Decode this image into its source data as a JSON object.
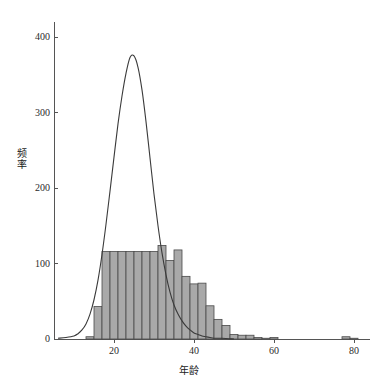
{
  "chart_data": {
    "type": "bar",
    "title": "",
    "subtitle": "",
    "xlabel": "年龄",
    "ylabel": "频率",
    "xlim": [
      5,
      84
    ],
    "ylim": [
      0,
      420
    ],
    "grid": false,
    "legend": null,
    "x_ticks": [
      {
        "value": 20,
        "label": "20"
      },
      {
        "value": 40,
        "label": "40"
      },
      {
        "value": 60,
        "label": "60"
      },
      {
        "value": 80,
        "label": "80"
      }
    ],
    "y_ticks": [
      {
        "value": 0,
        "label": "0"
      },
      {
        "value": 100,
        "label": "100"
      },
      {
        "value": 200,
        "label": "200"
      },
      {
        "value": 300,
        "label": "300"
      },
      {
        "value": 400,
        "label": "400"
      }
    ],
    "bin_width": 2,
    "bar_fill": "#a9a9a9",
    "bar_stroke": "#4a4a4a",
    "curve_color": "#3a3a3a",
    "axis_color": "#555555",
    "bars": [
      {
        "x0": 13,
        "x1": 15,
        "height": 3
      },
      {
        "x0": 15,
        "x1": 17,
        "height": 43
      },
      {
        "x0": 17,
        "x1": 19,
        "height": 116
      },
      {
        "x0": 19,
        "x1": 21,
        "height": 116
      },
      {
        "x0": 21,
        "x1": 23,
        "height": 116
      },
      {
        "x0": 23,
        "x1": 25,
        "height": 116
      },
      {
        "x0": 25,
        "x1": 27,
        "height": 116
      },
      {
        "x0": 27,
        "x1": 29,
        "height": 116
      },
      {
        "x0": 29,
        "x1": 31,
        "height": 116
      },
      {
        "x0": 31,
        "x1": 33,
        "height": 124
      },
      {
        "x0": 33,
        "x1": 35,
        "height": 104
      },
      {
        "x0": 35,
        "x1": 37,
        "height": 118
      },
      {
        "x0": 37,
        "x1": 39,
        "height": 83
      },
      {
        "x0": 39,
        "x1": 41,
        "height": 73
      },
      {
        "x0": 41,
        "x1": 43,
        "height": 74
      },
      {
        "x0": 43,
        "x1": 45,
        "height": 44
      },
      {
        "x0": 45,
        "x1": 47,
        "height": 26
      },
      {
        "x0": 47,
        "x1": 49,
        "height": 18
      },
      {
        "x0": 49,
        "x1": 51,
        "height": 6
      },
      {
        "x0": 51,
        "x1": 53,
        "height": 5
      },
      {
        "x0": 53,
        "x1": 55,
        "height": 5
      },
      {
        "x0": 55,
        "x1": 57,
        "height": 2
      },
      {
        "x0": 57,
        "x1": 59,
        "height": 1
      },
      {
        "x0": 59,
        "x1": 61,
        "height": 2
      },
      {
        "x0": 77,
        "x1": 79,
        "height": 3
      },
      {
        "x0": 79,
        "x1": 81,
        "height": 1
      }
    ],
    "curve": {
      "name": "density-curve",
      "peak_x": 24,
      "peak_y": 375,
      "points": [
        {
          "x": 6,
          "y": 1
        },
        {
          "x": 8,
          "y": 2
        },
        {
          "x": 10,
          "y": 4
        },
        {
          "x": 11,
          "y": 7
        },
        {
          "x": 12,
          "y": 12
        },
        {
          "x": 13,
          "y": 20
        },
        {
          "x": 14,
          "y": 33
        },
        {
          "x": 15,
          "y": 52
        },
        {
          "x": 16,
          "y": 78
        },
        {
          "x": 17,
          "y": 112
        },
        {
          "x": 18,
          "y": 152
        },
        {
          "x": 19,
          "y": 196
        },
        {
          "x": 20,
          "y": 241
        },
        {
          "x": 21,
          "y": 285
        },
        {
          "x": 22,
          "y": 322
        },
        {
          "x": 23,
          "y": 352
        },
        {
          "x": 24,
          "y": 373
        },
        {
          "x": 25,
          "y": 375
        },
        {
          "x": 26,
          "y": 360
        },
        {
          "x": 27,
          "y": 330
        },
        {
          "x": 28,
          "y": 288
        },
        {
          "x": 29,
          "y": 240
        },
        {
          "x": 30,
          "y": 192
        },
        {
          "x": 31,
          "y": 150
        },
        {
          "x": 32,
          "y": 114
        },
        {
          "x": 33,
          "y": 85
        },
        {
          "x": 34,
          "y": 62
        },
        {
          "x": 35,
          "y": 45
        },
        {
          "x": 36,
          "y": 33
        },
        {
          "x": 37,
          "y": 24
        },
        {
          "x": 38,
          "y": 17
        },
        {
          "x": 39,
          "y": 12
        },
        {
          "x": 40,
          "y": 8
        },
        {
          "x": 41,
          "y": 6
        },
        {
          "x": 42,
          "y": 4
        },
        {
          "x": 43,
          "y": 3
        },
        {
          "x": 44,
          "y": 2
        },
        {
          "x": 45,
          "y": 1
        },
        {
          "x": 47,
          "y": 1
        },
        {
          "x": 50,
          "y": 0
        }
      ]
    }
  }
}
